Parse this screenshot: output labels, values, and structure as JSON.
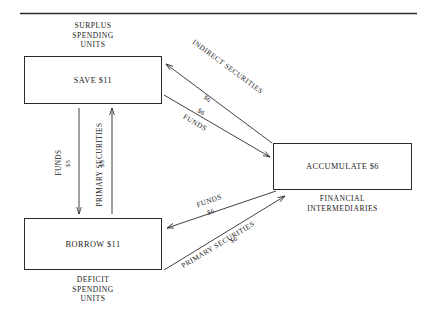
{
  "figure": {
    "top_rule": true
  },
  "nodes": {
    "surplus": {
      "caption": "SURPLUS\nSPENDING\nUNITS",
      "box_label": "SAVE $11"
    },
    "deficit": {
      "caption": "DEFICIT\nSPENDING\nUNITS",
      "box_label": "BORROW $11"
    },
    "intermediaries": {
      "caption": "FINANCIAL\nINTERMEDIARIES",
      "box_label": "ACCUMULATE $6"
    }
  },
  "edges": {
    "indirect_securities": {
      "label": "INDIRECT SECURITIES",
      "amount": "$6"
    },
    "funds_to_intermediaries": {
      "label": "FUNDS",
      "amount": "$6"
    },
    "funds_to_borrow": {
      "label": "FUNDS",
      "amount": "$6"
    },
    "primary_securities_to_intermediaries": {
      "label": "PRIMARY SECURITIES",
      "amount": "$6"
    },
    "funds_direct": {
      "label": "FUNDS",
      "amount": "$5"
    },
    "primary_securities_direct": {
      "label": "PRIMARY SECURITIES",
      "amount": "$5"
    }
  }
}
